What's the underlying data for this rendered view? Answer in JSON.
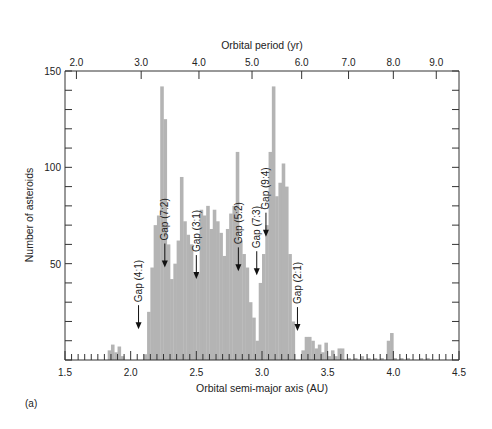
{
  "chart_data": {
    "type": "bar",
    "subtype": "histogram",
    "title": "",
    "xlabel": "Orbital semi-major axis (AU)",
    "ylabel": "Number of asteroids",
    "top_xlabel": "Orbital period (yr)",
    "xlim": [
      1.5,
      4.5
    ],
    "ylim": [
      0,
      150
    ],
    "x_ticks": [
      "1.5",
      "2.0",
      "2.5",
      "3.0",
      "3.5",
      "4.0",
      "4.5"
    ],
    "x_tick_values": [
      1.5,
      2.0,
      2.5,
      3.0,
      3.5,
      4.0,
      4.5
    ],
    "y_ticks": [
      "50",
      "100",
      "150"
    ],
    "y_tick_values": [
      50,
      100,
      150
    ],
    "top_ticks": [
      "2.0",
      "3.0",
      "4.0",
      "5.0",
      "6.0",
      "7.0",
      "8.0",
      "9.0"
    ],
    "top_tick_positions_au": [
      1.587,
      2.08,
      2.52,
      2.924,
      3.302,
      3.659,
      4.0,
      4.327
    ],
    "bar_color": "#b4b4b4",
    "grid": false,
    "bin_width": 0.025,
    "bins_start": [
      1.825,
      1.85,
      1.875,
      1.9,
      1.925,
      2.1,
      2.125,
      2.15,
      2.175,
      2.2,
      2.225,
      2.25,
      2.275,
      2.3,
      2.325,
      2.35,
      2.375,
      2.4,
      2.425,
      2.45,
      2.475,
      2.5,
      2.525,
      2.55,
      2.575,
      2.6,
      2.625,
      2.65,
      2.675,
      2.7,
      2.725,
      2.75,
      2.775,
      2.8,
      2.825,
      2.85,
      2.875,
      2.9,
      2.925,
      2.95,
      2.975,
      3.0,
      3.025,
      3.05,
      3.075,
      3.1,
      3.125,
      3.15,
      3.175,
      3.2,
      3.225,
      3.3,
      3.325,
      3.35,
      3.375,
      3.4,
      3.425,
      3.45,
      3.475,
      3.5,
      3.525,
      3.55,
      3.575,
      3.6,
      3.65,
      3.7,
      3.75,
      3.8,
      3.85,
      3.9,
      3.95,
      3.975,
      4.0,
      4.05,
      4.1,
      4.2,
      4.25
    ],
    "values": [
      5,
      8,
      4,
      7,
      2,
      3,
      25,
      48,
      70,
      75,
      142,
      125,
      60,
      42,
      50,
      62,
      95,
      72,
      65,
      60,
      45,
      45,
      78,
      75,
      80,
      68,
      78,
      72,
      66,
      54,
      68,
      76,
      80,
      108,
      62,
      55,
      48,
      30,
      22,
      10,
      40,
      55,
      70,
      108,
      142,
      85,
      92,
      102,
      90,
      55,
      20,
      5,
      12,
      12,
      10,
      6,
      8,
      4,
      9,
      2,
      5,
      2,
      6,
      6,
      1,
      1,
      2,
      1,
      1,
      1,
      10,
      14,
      1,
      1,
      1,
      1,
      1
    ],
    "annotations": [
      {
        "text": "Gap (4:1)",
        "x": 2.06,
        "arrow_tip_y": 16
      },
      {
        "text": "Gap (7:2)",
        "x": 2.26,
        "arrow_tip_y": 48
      },
      {
        "text": "Gap (3:1)",
        "x": 2.5,
        "arrow_tip_y": 42
      },
      {
        "text": "Gap (5:2)",
        "x": 2.82,
        "arrow_tip_y": 46
      },
      {
        "text": "Gap (7:3)",
        "x": 2.96,
        "arrow_tip_y": 44
      },
      {
        "text": "Gap (9:4)",
        "x": 3.03,
        "arrow_tip_y": 64
      },
      {
        "text": "Gap (2:1)",
        "x": 3.27,
        "arrow_tip_y": 15
      }
    ]
  },
  "figure": {
    "panel_label": "(a)"
  }
}
